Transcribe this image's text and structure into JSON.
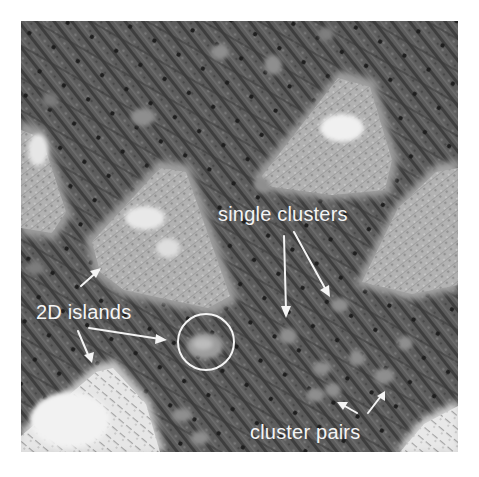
{
  "figure": {
    "type": "STM micrograph",
    "background_color": "#ffffff",
    "substrate_color": "#5a5a5a",
    "island_color": "#b8b8b8",
    "bright_island_color": "#ececec",
    "annotation_color": "#f4f4f4"
  },
  "annotations": {
    "single_clusters": {
      "text": "single clusters",
      "arrows": 2
    },
    "islands_2d": {
      "text": "2D islands",
      "arrows": 3,
      "circle_marker": true
    },
    "cluster_pairs": {
      "text": "cluster pairs",
      "arrows": 2
    }
  }
}
